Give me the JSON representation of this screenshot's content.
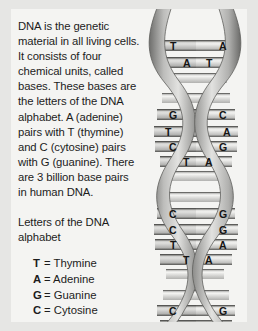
{
  "figure": {
    "title_text": "DNA structure infographic",
    "background_color": "#e6e6e4",
    "panel_color": "#f4f4f2",
    "text_color": "#1c1c1c"
  },
  "body": {
    "intro_paragraph": "DNA is the genetic material in all living cells. It consists of four chemical units, called bases. These bases are the letters of the DNA alphabet. A (adenine) pairs with T (thymine) and C (cytosine) pairs with G (guanine). There are 3 billion base pairs in human DNA.",
    "legend_heading": "Letters of the DNA alphabet",
    "legend": [
      {
        "letter": "T",
        "equals": "= Thymine"
      },
      {
        "letter": "A",
        "equals": "= Adenine"
      },
      {
        "letter": "G",
        "equals": "= Guanine"
      },
      {
        "letter": "C",
        "equals": "= Cytosine"
      }
    ]
  },
  "diagram": {
    "name": "dna-double-helix",
    "strand_color_light": "#d8d8d6",
    "strand_color_mid": "#9a9a98",
    "strand_color_dark": "#6e6e6c",
    "rung_color_light": "#eeeeec",
    "rung_color_dark": "#b4b4b2",
    "base_pairs": [
      {
        "left": "T",
        "right": "A",
        "y": 37
      },
      {
        "left": "A",
        "right": "T",
        "y": 54
      },
      {
        "left": "G",
        "right": "C",
        "y": 106
      },
      {
        "left": "T",
        "right": "A",
        "y": 123
      },
      {
        "left": "C",
        "right": "G",
        "y": 138
      },
      {
        "left": "T",
        "right": "A",
        "y": 153
      },
      {
        "left": "C",
        "right": "G",
        "y": 205
      },
      {
        "left": "C",
        "right": "G",
        "y": 221
      },
      {
        "left": "T",
        "right": "A",
        "y": 236
      },
      {
        "left": "T",
        "right": "A",
        "y": 251
      },
      {
        "left": "C",
        "right": "G",
        "y": 302
      },
      {
        "left": "T",
        "right": "A",
        "y": 317
      }
    ]
  }
}
